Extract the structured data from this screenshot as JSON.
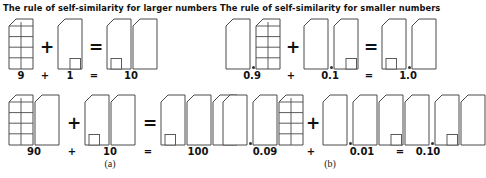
{
  "figure": {
    "caption_a": "(a)",
    "caption_b": "(b)"
  },
  "panels": [
    {
      "id": "larger-numbers",
      "heading": "The rule of self-similarity for larger numbers",
      "equations": [
        {
          "id": "9-plus-1",
          "terms": [
            {
              "label": "9",
              "blocks": [
                "grid"
              ]
            },
            {
              "label": "1",
              "blocks": [
                "unit"
              ]
            },
            {
              "label": "10",
              "blocks": [
                "unit",
                "solid"
              ]
            }
          ],
          "operators": {
            "plus": "+",
            "equals": "="
          }
        },
        {
          "id": "90-plus-10",
          "terms": [
            {
              "label": "90",
              "blocks": [
                "grid",
                "solid"
              ]
            },
            {
              "label": "10",
              "blocks": [
                "unit",
                "solid"
              ]
            },
            {
              "label": "100",
              "blocks": [
                "unit",
                "solid",
                "solid"
              ]
            }
          ],
          "operators": {
            "plus": "+",
            "equals": "="
          }
        }
      ]
    },
    {
      "id": "smaller-numbers",
      "heading": "The rule of self-similarity for smaller numbers",
      "equations": [
        {
          "id": "0.9-plus-0.1",
          "terms": [
            {
              "label": "0.9",
              "blocks": [
                "solid",
                "dot",
                "grid"
              ]
            },
            {
              "label": "0.1",
              "blocks": [
                "solid",
                "dot",
                "unit"
              ]
            },
            {
              "label": "1.0",
              "blocks": [
                "solid",
                "unit",
                "dot"
              ]
            }
          ],
          "operators": {
            "plus": "+",
            "equals": "="
          }
        },
        {
          "id": "0.09-plus-0.01",
          "terms": [
            {
              "label": "0.09",
              "blocks": [
                "solid",
                "dot",
                "solid",
                "grid"
              ]
            },
            {
              "label": "0.01",
              "blocks": [
                "solid",
                "dot",
                "solid",
                "unit"
              ]
            },
            {
              "label": "0.10",
              "blocks": [
                "solid",
                "dot",
                "unit",
                "solid"
              ]
            }
          ],
          "operators": {
            "plus": "+",
            "equals": "="
          }
        }
      ]
    }
  ],
  "style": {
    "stroke": "#4a4a4a",
    "fill": "#ffffff",
    "grid_cols": 2,
    "grid_rows": 5,
    "text_color": "#111111"
  }
}
